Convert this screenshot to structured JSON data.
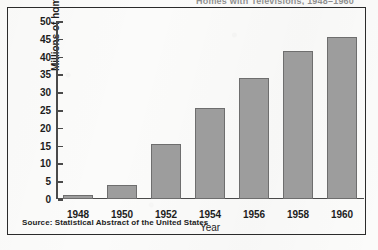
{
  "figure": {
    "clipped_title": "Homes with Televisions, 1948–1960",
    "source_note": "Source: Statistical Abstract of the United States"
  },
  "chart_data": {
    "type": "bar",
    "title": "",
    "xlabel": "Year",
    "ylabel": "Millions of homes",
    "categories": [
      "1948",
      "1950",
      "1952",
      "1954",
      "1956",
      "1958",
      "1960"
    ],
    "values": [
      1,
      4,
      15.5,
      25.7,
      34,
      41.7,
      45.6
    ],
    "ylim": [
      0,
      50
    ],
    "ytick_labels": [
      "0",
      "5",
      "10",
      "15",
      "20",
      "25",
      "30",
      "35",
      "40",
      "45",
      "50"
    ],
    "ytick_values": [
      0,
      5,
      10,
      15,
      20,
      25,
      30,
      35,
      40,
      45,
      50
    ],
    "grid": false,
    "legend": false,
    "bar_color": "#9d9d9d",
    "bar_edge_color": "#6e6e6e",
    "axis_color": "#4a4a4a",
    "text_color": "#1d1d1d",
    "frame_color": "#2b2b2b",
    "background_color": "#fbfbfa"
  }
}
